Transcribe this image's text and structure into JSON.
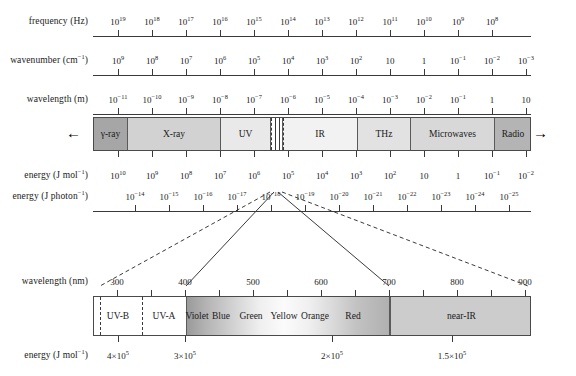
{
  "figure": {
    "background": "#ffffff",
    "line_color": "#3a3a3a"
  },
  "rows": {
    "frequency": {
      "label": "frequency (Hz)",
      "unit": "Hz",
      "ticks": [
        {
          "text": "10",
          "exp": "19",
          "x": 118
        },
        {
          "text": "10",
          "exp": "18",
          "x": 152
        },
        {
          "text": "10",
          "exp": "17",
          "x": 186
        },
        {
          "text": "10",
          "exp": "16",
          "x": 220
        },
        {
          "text": "10",
          "exp": "15",
          "x": 254
        },
        {
          "text": "10",
          "exp": "14",
          "x": 288
        },
        {
          "text": "10",
          "exp": "13",
          "x": 322
        },
        {
          "text": "10",
          "exp": "12",
          "x": 356
        },
        {
          "text": "10",
          "exp": "11",
          "x": 390
        },
        {
          "text": "10",
          "exp": "10",
          "x": 424
        },
        {
          "text": "10",
          "exp": "9",
          "x": 458
        },
        {
          "text": "10",
          "exp": "8",
          "x": 492
        }
      ]
    },
    "wavenumber": {
      "label": "wavenumber (cm",
      "label_sup": "−1",
      "label_tail": ")",
      "ticks": [
        {
          "text": "10",
          "exp": "9",
          "x": 118
        },
        {
          "text": "10",
          "exp": "8",
          "x": 152
        },
        {
          "text": "10",
          "exp": "7",
          "x": 186
        },
        {
          "text": "10",
          "exp": "6",
          "x": 220
        },
        {
          "text": "10",
          "exp": "5",
          "x": 254
        },
        {
          "text": "10",
          "exp": "4",
          "x": 288
        },
        {
          "text": "10",
          "exp": "3",
          "x": 322
        },
        {
          "text": "10",
          "exp": "2",
          "x": 356
        },
        {
          "text": "10",
          "exp": "",
          "x": 390
        },
        {
          "text": "1",
          "exp": "",
          "x": 424
        },
        {
          "text": "10",
          "exp": "−1",
          "x": 458
        },
        {
          "text": "10",
          "exp": "−2",
          "x": 492
        },
        {
          "text": "10",
          "exp": "−3",
          "x": 526
        }
      ]
    },
    "wavelength_m": {
      "label": "wavelength (m)",
      "ticks": [
        {
          "text": "10",
          "exp": "−11",
          "x": 118
        },
        {
          "text": "10",
          "exp": "−10",
          "x": 152
        },
        {
          "text": "10",
          "exp": "−9",
          "x": 186
        },
        {
          "text": "10",
          "exp": "−8",
          "x": 220
        },
        {
          "text": "10",
          "exp": "−7",
          "x": 254
        },
        {
          "text": "10",
          "exp": "−6",
          "x": 288
        },
        {
          "text": "10",
          "exp": "−5",
          "x": 322
        },
        {
          "text": "10",
          "exp": "−4",
          "x": 356
        },
        {
          "text": "10",
          "exp": "−3",
          "x": 390
        },
        {
          "text": "10",
          "exp": "−2",
          "x": 424
        },
        {
          "text": "10",
          "exp": "−1",
          "x": 458
        },
        {
          "text": "1",
          "exp": "",
          "x": 492
        },
        {
          "text": "10",
          "exp": "",
          "x": 526
        }
      ]
    },
    "energy_mol": {
      "label": "energy (J mol",
      "label_sup": "−1",
      "label_tail": ")",
      "ticks": [
        {
          "text": "10",
          "exp": "10",
          "x": 118
        },
        {
          "text": "10",
          "exp": "9",
          "x": 152
        },
        {
          "text": "10",
          "exp": "8",
          "x": 186
        },
        {
          "text": "10",
          "exp": "7",
          "x": 220
        },
        {
          "text": "10",
          "exp": "6",
          "x": 254
        },
        {
          "text": "10",
          "exp": "5",
          "x": 288
        },
        {
          "text": "10",
          "exp": "4",
          "x": 322
        },
        {
          "text": "10",
          "exp": "3",
          "x": 356
        },
        {
          "text": "10",
          "exp": "2",
          "x": 390
        },
        {
          "text": "10",
          "exp": "",
          "x": 424
        },
        {
          "text": "1",
          "exp": "",
          "x": 458
        },
        {
          "text": "10",
          "exp": "−1",
          "x": 492
        },
        {
          "text": "10",
          "exp": "−2",
          "x": 526
        }
      ]
    },
    "energy_photon": {
      "label": "energy (J photon",
      "label_sup": "−1",
      "label_tail": ")",
      "ticks": [
        {
          "text": "10",
          "exp": "−14",
          "x": 135
        },
        {
          "text": "10",
          "exp": "−15",
          "x": 169
        },
        {
          "text": "10",
          "exp": "−16",
          "x": 203
        },
        {
          "text": "10",
          "exp": "−17",
          "x": 237
        },
        {
          "text": "10",
          "exp": "−18",
          "x": 271
        },
        {
          "text": "10",
          "exp": "−19",
          "x": 305
        },
        {
          "text": "10",
          "exp": "−20",
          "x": 339
        },
        {
          "text": "10",
          "exp": "−21",
          "x": 373
        },
        {
          "text": "10",
          "exp": "−22",
          "x": 407
        },
        {
          "text": "10",
          "exp": "−23",
          "x": 441
        },
        {
          "text": "10",
          "exp": "−24",
          "x": 475
        },
        {
          "text": "10",
          "exp": "−25",
          "x": 509
        }
      ]
    },
    "wavelength_nm": {
      "label": "wavelength (nm)",
      "ticks": [
        {
          "text": "300",
          "exp": "",
          "x": 117
        },
        {
          "text": "400",
          "exp": "",
          "x": 185
        },
        {
          "text": "500",
          "exp": "",
          "x": 253
        },
        {
          "text": "600",
          "exp": "",
          "x": 321
        },
        {
          "text": "700",
          "exp": "",
          "x": 389
        },
        {
          "text": "800",
          "exp": "",
          "x": 457
        },
        {
          "text": "900",
          "exp": "",
          "x": 525
        }
      ],
      "minor_ticks_x": [
        151,
        219,
        287,
        355,
        423,
        491
      ]
    },
    "energy_mol_vis": {
      "label": "energy (J mol",
      "label_sup": "−1",
      "label_tail": ")",
      "ticks": [
        {
          "text": "4×10",
          "exp": "5",
          "x": 118
        },
        {
          "text": "3×10",
          "exp": "5",
          "x": 185
        },
        {
          "text": "2×10",
          "exp": "5",
          "x": 332
        },
        {
          "text": "1.5×10",
          "exp": "5",
          "x": 452
        }
      ]
    }
  },
  "main_band": {
    "left": 93,
    "right": 531,
    "segments": [
      {
        "name": "gamma-ray",
        "label": "γ-ray",
        "x0": 93,
        "x1": 127,
        "fill": "#a6a6a6"
      },
      {
        "name": "x-ray",
        "label": "X-ray",
        "x0": 127,
        "x1": 220,
        "fill": "#d2d2d2"
      },
      {
        "name": "uv",
        "label": "UV",
        "x0": 220,
        "x1": 270,
        "fill": "#e9e9e9"
      },
      {
        "name": "visible",
        "label": "",
        "x0": 270,
        "x1": 282,
        "fill": "#ffffff"
      },
      {
        "name": "ir",
        "label": "IR",
        "x0": 282,
        "x1": 357,
        "fill": "#f2f2f2"
      },
      {
        "name": "thz",
        "label": "THz",
        "x0": 357,
        "x1": 410,
        "fill": "#e2e2e2"
      },
      {
        "name": "microwaves",
        "label": "Microwaves",
        "x0": 410,
        "x1": 494,
        "fill": "#d8d8d8"
      },
      {
        "name": "radio",
        "label": "Radio",
        "x0": 494,
        "x1": 531,
        "fill": "#b4b4b4"
      }
    ],
    "arrow_left": "←",
    "arrow_right": "→",
    "dashed_marks_x": [
      270,
      282
    ],
    "solid_marks_x": [
      274,
      278
    ]
  },
  "visible_band": {
    "left": 93,
    "right": 531,
    "segments": [
      {
        "name": "uv-b",
        "label": "UV-B",
        "x0": 93,
        "x1": 141,
        "fill": "#ffffff"
      },
      {
        "name": "uv-a",
        "label": "UV-A",
        "x0": 141,
        "x1": 185,
        "fill": "#ffffff"
      },
      {
        "name": "near-ir",
        "label": "near-IR",
        "x0": 389,
        "x1": 531,
        "fill": "#cccccc"
      }
    ],
    "colors": [
      {
        "name": "violet",
        "label": "Violet",
        "x0": 185,
        "x1": 207,
        "center": 196
      },
      {
        "name": "blue",
        "label": "Blue",
        "x0": 207,
        "x1": 232,
        "center": 220
      },
      {
        "name": "green",
        "label": "Green",
        "x0": 232,
        "x1": 268,
        "center": 250
      },
      {
        "name": "yellow",
        "label": "Yellow",
        "x0": 268,
        "x1": 297,
        "center": 283
      },
      {
        "name": "orange",
        "label": "Orange",
        "x0": 297,
        "x1": 330,
        "center": 314
      },
      {
        "name": "red",
        "label": "Red",
        "x0": 330,
        "x1": 389,
        "center": 352
      }
    ],
    "uvb_dash_left_x": 99,
    "uvb_dash_right_x": 141
  },
  "connectors": {
    "dashed": [
      {
        "name": "left-outer",
        "x1": 270,
        "y1": 192,
        "x2": 100,
        "y2": 286
      },
      {
        "name": "right-outer",
        "x1": 282,
        "y1": 192,
        "x2": 528,
        "y2": 286
      }
    ],
    "solid": [
      {
        "name": "left-inner",
        "x1": 274,
        "y1": 192,
        "x2": 186,
        "y2": 286
      },
      {
        "name": "right-inner",
        "x1": 278,
        "y1": 192,
        "x2": 389,
        "y2": 286
      }
    ]
  }
}
